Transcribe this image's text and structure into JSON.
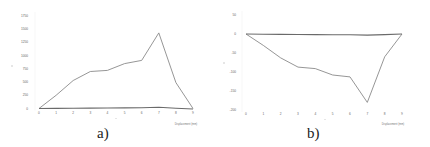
{
  "chart_data": [
    {
      "id": "a",
      "type": "line",
      "caption": "a)",
      "title": "",
      "xlabel": "",
      "x_unit_label": "Displacement (mm)",
      "ylabel": "",
      "x": [
        0,
        1,
        2,
        3,
        4,
        5,
        6,
        7,
        8,
        9
      ],
      "xticks": [
        "0",
        "1",
        "2",
        "3",
        "4",
        "5",
        "6",
        "7",
        "8",
        "9"
      ],
      "yticks": [
        "0",
        "250",
        "500",
        "750",
        "1000",
        "1250",
        "1500",
        "1750"
      ],
      "ylim": [
        0,
        1750
      ],
      "grid": false,
      "legend": null,
      "series": [
        {
          "name": "series-1",
          "color": "#8a8a8a",
          "values": [
            0,
            250,
            530,
            700,
            720,
            850,
            910,
            1430,
            490,
            0
          ]
        },
        {
          "name": "series-2",
          "color": "#6a6a6a",
          "values": [
            0,
            2,
            5,
            8,
            10,
            12,
            15,
            25,
            5,
            -10
          ]
        }
      ]
    },
    {
      "id": "b",
      "type": "line",
      "caption": "b)",
      "title": "",
      "xlabel": "",
      "x_unit_label": "Displacement (mm)",
      "ylabel": "",
      "x": [
        0,
        1,
        2,
        3,
        4,
        5,
        6,
        7,
        8,
        9
      ],
      "xticks": [
        "0",
        "1",
        "2",
        "3",
        "4",
        "5",
        "6",
        "7",
        "8",
        "9"
      ],
      "yticks": [
        "50",
        "0",
        "-50",
        "-100",
        "-150",
        "-200"
      ],
      "ylim": [
        -200,
        50
      ],
      "grid": false,
      "legend": null,
      "series": [
        {
          "name": "series-1",
          "color": "#8a8a8a",
          "values": [
            0,
            -30,
            -63,
            -87,
            -91,
            -108,
            -113,
            -180,
            -60,
            0
          ]
        },
        {
          "name": "series-2",
          "color": "#6a6a6a",
          "values": [
            0,
            -0.5,
            -1,
            -1.2,
            -1.5,
            -1.8,
            -2,
            -3,
            -1.5,
            0
          ]
        }
      ]
    }
  ]
}
